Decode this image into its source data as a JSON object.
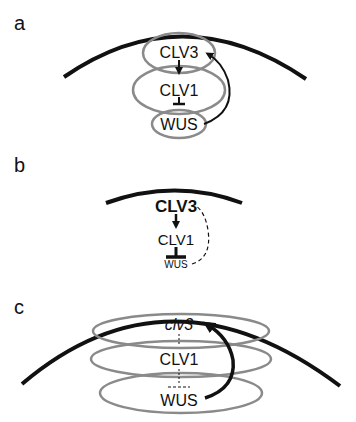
{
  "panels": [
    {
      "label": "a",
      "nodes": {
        "top": "CLV3",
        "middle": "CLV1",
        "bottom": "WUS"
      },
      "relations": [
        {
          "from": "CLV3",
          "to": "CLV1",
          "type": "activation"
        },
        {
          "from": "CLV1",
          "to": "WUS",
          "type": "inhibition"
        },
        {
          "from": "WUS",
          "to": "CLV3",
          "type": "activation",
          "style": "curved"
        }
      ]
    },
    {
      "label": "b",
      "nodes": {
        "top": "CLV3",
        "middle": "CLV1",
        "bottom": "WUS"
      },
      "relations": [
        {
          "from": "CLV3",
          "to": "CLV1",
          "type": "activation"
        },
        {
          "from": "CLV1",
          "to": "WUS",
          "type": "inhibition"
        },
        {
          "from": "WUS",
          "to": "CLV3",
          "type": "link",
          "style": "dashed"
        }
      ]
    },
    {
      "label": "c",
      "nodes": {
        "top": "clv3",
        "middle": "CLV1",
        "bottom": "WUS"
      },
      "relations": [
        {
          "from": "clv3",
          "to": "CLV1",
          "type": "broken",
          "style": "dashed"
        },
        {
          "from": "CLV1",
          "to": "WUS",
          "type": "broken-inhibition",
          "style": "dashed"
        },
        {
          "from": "WUS",
          "to": "clv3",
          "type": "activation",
          "style": "curved-bold"
        }
      ]
    }
  ],
  "colors": {
    "ink": "#111111",
    "ellipse": "#8a8a8a",
    "background": "#ffffff"
  }
}
